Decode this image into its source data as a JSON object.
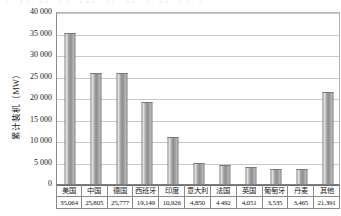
{
  "top_caption": "。 。。 。。 。。 ，。。 。。 。。 。 。。 。。 。",
  "chart_data": {
    "type": "bar",
    "title": "",
    "xlabel": "",
    "ylabel": "累计装机（MW）",
    "ylim": [
      0,
      40000
    ],
    "yticks": [
      "0",
      "5 000",
      "10 000",
      "15 000",
      "20 000",
      "25 000",
      "30 000",
      "35 000",
      "40 000"
    ],
    "ytick_values": [
      0,
      5000,
      10000,
      15000,
      20000,
      25000,
      30000,
      35000,
      40000
    ],
    "grid": true,
    "legend": "none",
    "categories": [
      "美国",
      "中国",
      "德国",
      "西班牙",
      "印度",
      "意大利",
      "法国",
      "英国",
      "葡萄牙",
      "丹麦",
      "其他"
    ],
    "values": [
      35064,
      25805,
      25777,
      19149,
      10926,
      4850,
      4492,
      4051,
      3535,
      3465,
      21391
    ],
    "value_labels": [
      "35,064",
      "25,805",
      "25,777",
      "19,149",
      "10,926",
      "4,850",
      "4 492",
      "4,051",
      "3,535",
      "3,465",
      "21,391"
    ]
  }
}
